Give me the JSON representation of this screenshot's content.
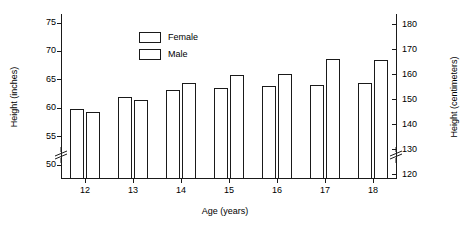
{
  "chart_data": {
    "type": "bar",
    "title": "",
    "subtitle": "",
    "xlabel": "Age (years)",
    "ylabel": "Height (inches)",
    "ylabel_secondary": "Height (centimeters)",
    "categories": [
      "12",
      "13",
      "14",
      "15",
      "16",
      "17",
      "18"
    ],
    "series": [
      {
        "name": "Female",
        "values": [
          59.8,
          62.0,
          63.2,
          63.5,
          63.8,
          64.1,
          64.4
        ]
      },
      {
        "name": "Male",
        "values": [
          59.2,
          61.3,
          64.3,
          65.8,
          66.0,
          68.6,
          68.5
        ]
      }
    ],
    "ylim": [
      47.5,
      76.5
    ],
    "yticks": [
      50,
      55,
      60,
      65,
      70,
      75
    ],
    "ylim_secondary": [
      118,
      184
    ],
    "yticks_secondary": [
      120,
      130,
      140,
      150,
      160,
      170,
      180
    ],
    "axis_break": true,
    "axis_break_note": "y-axis broken below lowest tick on both left and right scales",
    "grid": false,
    "legend_position": "top-left",
    "bar_fill": "#ffffff",
    "bar_edge": "#1a1a1a"
  },
  "legend": {
    "items": [
      {
        "label": "Female",
        "swatch": "legend-swatch-female"
      },
      {
        "label": "Male",
        "swatch": "legend-swatch-male"
      }
    ]
  },
  "axes": {
    "left": {
      "title": "Height (inches)",
      "ticklabels": [
        "75",
        "70",
        "65",
        "60",
        "55",
        "50"
      ]
    },
    "right": {
      "title": "Height (centimeters)",
      "ticklabels": [
        "180",
        "170",
        "160",
        "150",
        "140",
        "130",
        "120"
      ]
    },
    "bottom": {
      "title": "Age (years)",
      "ticklabels": [
        "12",
        "13",
        "14",
        "15",
        "16",
        "17",
        "18"
      ]
    }
  }
}
